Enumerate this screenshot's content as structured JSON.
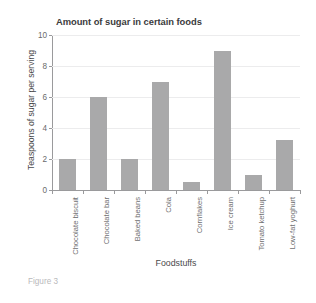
{
  "figure": {
    "caption": "Figure 3"
  },
  "chart_data": {
    "type": "bar",
    "title": "Amount of sugar in certain foods",
    "xlabel": "Foodstuffs",
    "ylabel": "Teaspoons of sugar per serving",
    "categories": [
      "Chocolate biscuit",
      "Chocolate bar",
      "Baked beans",
      "Cola",
      "Cornflakes",
      "Ice cream",
      "Tomato ketchup",
      "Low-fat yoghurt"
    ],
    "values": [
      2,
      6,
      2,
      7,
      0.5,
      9,
      1,
      3.2
    ],
    "ylim": [
      0,
      10
    ],
    "yticks": [
      0,
      2,
      4,
      6,
      8,
      10
    ],
    "ytick_labels": [
      "0",
      "2",
      "4",
      "6",
      "8",
      "10"
    ],
    "grid": true,
    "legend": null,
    "bar_color": "#a9a9aa",
    "axis_color": "#9a9a9c",
    "gridline_color": "#ececed"
  }
}
